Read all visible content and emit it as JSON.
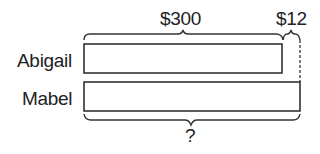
{
  "diagram": {
    "type": "bar-model",
    "top_labels": {
      "main": "$300",
      "extra": "$12"
    },
    "rows": [
      {
        "name": "Abigail"
      },
      {
        "name": "Mabel"
      }
    ],
    "bottom_label": "?"
  }
}
